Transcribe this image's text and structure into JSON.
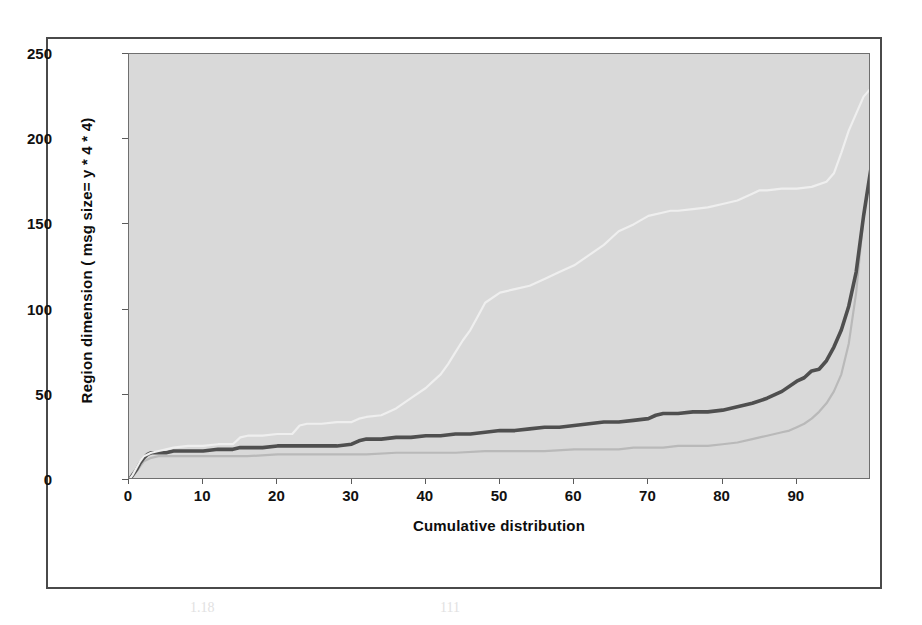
{
  "figure": {
    "legend": {
      "position": "top-center",
      "entries": [
        {
          "label": "Word",
          "color": "#b9b9b9",
          "width": 2.2
        },
        {
          "label": "Powerpoint",
          "color": "#4f4f4f",
          "width": 3.6
        },
        {
          "label": "Treeview",
          "color": "#efefef",
          "width": 2.2
        }
      ]
    },
    "y_axis": {
      "title": "Region dimension ( msg size= y * 4 * 4)",
      "ticks": [
        0,
        50,
        100,
        150,
        200,
        250
      ]
    },
    "x_axis": {
      "title": "Cumulative distribution",
      "ticks": [
        0,
        10,
        20,
        30,
        40,
        50,
        60,
        70,
        80,
        90
      ]
    },
    "plot_background": "#d9d9d9",
    "frame_color": "#4a4a4a"
  },
  "background_text": [
    {
      "text": "4.4.2",
      "x": 600,
      "y": 62,
      "size": 14
    },
    {
      "text": "of Region Representation: When the ... we have",
      "x": 505,
      "y": 88,
      "size": 15
    },
    {
      "text": "a region, we must consider the complexity of the",
      "x": 505,
      "y": 112,
      "size": 15
    },
    {
      "text": "operations. Do we have to keep a list of each",
      "x": 505,
      "y": 136,
      "size": 15
    },
    {
      "text": "region, and how do we combine them? Then we have to",
      "x": 505,
      "y": 160,
      "size": 15
    },
    {
      "text": "consider the bandwidth. It is also important to",
      "x": 505,
      "y": 184,
      "size": 15
    },
    {
      "text": "be able to compress and transmit",
      "x": 505,
      "y": 208,
      "size": 15
    },
    {
      "text": "efficiently, so we need a much simpler representation for a",
      "x": 490,
      "y": 232,
      "size": 15
    },
    {
      "text": "more efficient display.",
      "x": 505,
      "y": 256,
      "size": 15
    },
    {
      "text": "Compression Results",
      "x": 520,
      "y": 310,
      "size": 15
    },
    {
      "text": "In order to measure the bandwidth we have run",
      "x": 505,
      "y": 344,
      "size": 15
    },
    {
      "text": "several experiments on three applications",
      "x": 505,
      "y": 368,
      "size": 15
    },
    {
      "text": "ha",
      "x": 520,
      "y": 392,
      "size": 15
    },
    {
      "text": "a small set",
      "x": 150,
      "y": 88,
      "size": 15
    },
    {
      "text": "of the",
      "x": 170,
      "y": 112,
      "size": 15
    },
    {
      "text": "as the",
      "x": 200,
      "y": 136,
      "size": 15
    },
    {
      "text": "in the",
      "x": 230,
      "y": 160,
      "size": 15
    },
    {
      "text": "1.18",
      "x": 190,
      "y": 600,
      "size": 14
    },
    {
      "text": "111",
      "x": 440,
      "y": 600,
      "size": 14
    }
  ],
  "chart_data": {
    "type": "line",
    "title": "",
    "xlabel": "Cumulative distribution",
    "ylabel": "Region dimension ( msg size= y * 4 * 4)",
    "xlim": [
      0,
      100
    ],
    "ylim": [
      0,
      250
    ],
    "grid": false,
    "legend_position": "top",
    "series": [
      {
        "name": "Word",
        "color": "#b9b9b9",
        "line_width": 2.2,
        "x": [
          0,
          0.5,
          1,
          1.5,
          2,
          3,
          4,
          6,
          8,
          10,
          13,
          16,
          20,
          24,
          28,
          32,
          36,
          40,
          44,
          48,
          52,
          56,
          60,
          64,
          66,
          68,
          70,
          72,
          74,
          76,
          78,
          80,
          82,
          84,
          85,
          86,
          87,
          88,
          89,
          90,
          91,
          92,
          93,
          94,
          95,
          96,
          97,
          98,
          99,
          100
        ],
        "y": [
          0,
          2,
          5,
          8,
          11,
          13,
          14,
          14,
          14,
          14,
          14,
          14,
          15,
          15,
          15,
          15,
          16,
          16,
          16,
          17,
          17,
          17,
          18,
          18,
          18,
          19,
          19,
          19,
          20,
          20,
          20,
          21,
          22,
          24,
          25,
          26,
          27,
          28,
          29,
          31,
          33,
          36,
          40,
          45,
          52,
          62,
          80,
          110,
          155,
          183
        ]
      },
      {
        "name": "Powerpoint",
        "color": "#4f4f4f",
        "line_width": 3.6,
        "x": [
          0,
          0.5,
          1,
          1.5,
          2,
          2.5,
          3,
          4,
          5,
          6,
          8,
          10,
          12,
          14,
          15,
          16,
          18,
          20,
          24,
          28,
          30,
          31,
          32,
          34,
          36,
          38,
          40,
          42,
          44,
          46,
          48,
          50,
          52,
          54,
          56,
          58,
          60,
          62,
          64,
          66,
          68,
          70,
          71,
          72,
          74,
          76,
          78,
          80,
          82,
          84,
          86,
          88,
          90,
          91,
          92,
          93,
          94,
          95,
          96,
          97,
          98,
          99,
          100
        ],
        "y": [
          0,
          3,
          6,
          10,
          13,
          15,
          16,
          16,
          16,
          17,
          17,
          17,
          18,
          18,
          19,
          19,
          19,
          20,
          20,
          20,
          21,
          23,
          24,
          24,
          25,
          25,
          26,
          26,
          27,
          27,
          28,
          29,
          29,
          30,
          31,
          31,
          32,
          33,
          34,
          34,
          35,
          36,
          38,
          39,
          39,
          40,
          40,
          41,
          43,
          45,
          48,
          52,
          58,
          60,
          64,
          65,
          70,
          78,
          88,
          102,
          122,
          155,
          183
        ]
      },
      {
        "name": "Treeview",
        "color": "#efefef",
        "line_width": 2.2,
        "x": [
          0,
          0.5,
          1,
          1.5,
          2,
          3,
          4,
          5,
          6,
          8,
          10,
          12,
          14,
          15,
          16,
          18,
          20,
          22,
          23,
          24,
          26,
          28,
          30,
          31,
          32,
          34,
          36,
          38,
          40,
          41,
          42,
          43,
          44,
          45,
          46,
          47,
          48,
          50,
          52,
          54,
          56,
          58,
          60,
          62,
          64,
          65,
          66,
          68,
          70,
          72,
          73,
          74,
          76,
          78,
          80,
          82,
          84,
          85,
          86,
          88,
          90,
          92,
          94,
          95,
          96,
          97,
          98,
          99,
          100
        ],
        "y": [
          0,
          3,
          7,
          11,
          14,
          16,
          17,
          18,
          19,
          20,
          20,
          21,
          21,
          25,
          26,
          26,
          27,
          27,
          32,
          33,
          33,
          34,
          34,
          36,
          37,
          38,
          42,
          48,
          54,
          58,
          62,
          68,
          75,
          82,
          88,
          96,
          104,
          110,
          112,
          114,
          118,
          122,
          126,
          132,
          138,
          142,
          146,
          150,
          155,
          157,
          158,
          158,
          159,
          160,
          162,
          164,
          168,
          170,
          170,
          171,
          171,
          172,
          175,
          180,
          192,
          205,
          215,
          225,
          230
        ]
      }
    ]
  }
}
